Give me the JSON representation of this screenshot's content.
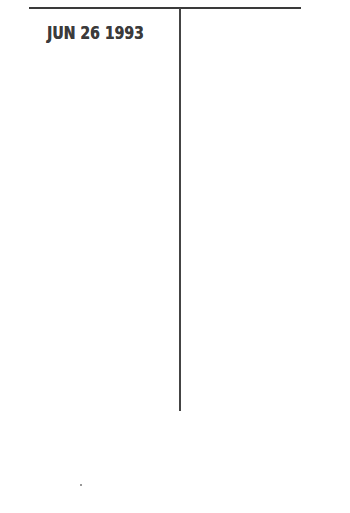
{
  "document": {
    "date_stamp": "JUN 26 1993",
    "ink_color": "#3b3b3b",
    "rule_color": "#3a3a3a",
    "background": "#ffffff"
  }
}
